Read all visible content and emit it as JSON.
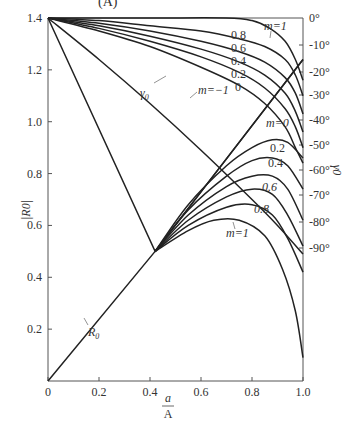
{
  "header": {
    "cropped_title_fragment": "(A)"
  },
  "chart_data": {
    "type": "line",
    "title": "",
    "xlabel": "a/A",
    "ylabel": "|R0|",
    "y2label": "γ0",
    "xlim": [
      0,
      1.0
    ],
    "ylim": [
      0,
      1.4
    ],
    "y2lim": [
      0,
      -90
    ],
    "grid": false,
    "x_ticks": [
      "0",
      "0.2",
      "0.4",
      "0.6",
      "0.8",
      "1.0"
    ],
    "y_ticks": [
      "1.4",
      "1.2",
      "1.0",
      "0.8",
      "0.6",
      "0.4",
      "0.2"
    ],
    "y2_ticks": [
      "0°",
      "-10°",
      "-20°",
      "-30°",
      "-40°",
      "-50°",
      "-60°",
      "-70°",
      "-80°",
      "-90°"
    ],
    "series": [
      {
        "name": "R0",
        "group": "magnitude",
        "label": "R0",
        "x": [
          0,
          0.42,
          1.0
        ],
        "y": [
          0,
          0.5,
          1.24
        ]
      },
      {
        "name": "|R0| m=0",
        "group": "magnitude",
        "label": "m=0",
        "x": [
          0.42,
          0.55,
          0.7,
          0.8,
          0.88,
          0.94,
          1.0
        ],
        "y": [
          0.5,
          0.68,
          0.83,
          0.9,
          0.93,
          0.92,
          0.86
        ]
      },
      {
        "name": "|R0| m=0.2",
        "group": "magnitude",
        "label": "0.2",
        "x": [
          0.42,
          0.55,
          0.7,
          0.8,
          0.88,
          0.94,
          1.0
        ],
        "y": [
          0.5,
          0.66,
          0.79,
          0.85,
          0.86,
          0.83,
          0.74
        ]
      },
      {
        "name": "|R0| m=0.4",
        "group": "magnitude",
        "label": "0.4",
        "x": [
          0.42,
          0.55,
          0.7,
          0.8,
          0.88,
          0.94,
          1.0
        ],
        "y": [
          0.5,
          0.64,
          0.75,
          0.79,
          0.79,
          0.74,
          0.62
        ]
      },
      {
        "name": "|R0| m=0.6",
        "group": "magnitude",
        "label": "0.6",
        "x": [
          0.42,
          0.55,
          0.7,
          0.8,
          0.88,
          0.94,
          1.0
        ],
        "y": [
          0.5,
          0.62,
          0.71,
          0.74,
          0.72,
          0.64,
          0.52
        ]
      },
      {
        "name": "|R0| m=0.8",
        "group": "magnitude",
        "label": "0.8",
        "x": [
          0.42,
          0.55,
          0.7,
          0.8,
          0.88,
          0.94,
          1.0
        ],
        "y": [
          0.5,
          0.6,
          0.67,
          0.68,
          0.64,
          0.55,
          0.42
        ]
      },
      {
        "name": "|R0| m=1",
        "group": "magnitude",
        "label": "m=1",
        "x": [
          0.42,
          0.55,
          0.65,
          0.75,
          0.85,
          0.92,
          0.97,
          1.0
        ],
        "y": [
          0.5,
          0.58,
          0.62,
          0.62,
          0.56,
          0.43,
          0.27,
          0.09
        ]
      },
      {
        "name": "γ0 m=-1",
        "group": "phase",
        "label": "m=-1",
        "x": [
          0,
          0.2,
          0.4,
          0.6,
          0.8,
          0.9,
          1.0
        ],
        "y": [
          1.4,
          1.24,
          1.07,
          0.89,
          0.7,
          0.6,
          0.49
        ]
      },
      {
        "name": "γ0 m=0",
        "group": "phase",
        "label": "0",
        "x": [
          0,
          0.2,
          0.4,
          0.6,
          0.75,
          0.85,
          0.93,
          0.97,
          1.0
        ],
        "y": [
          1.4,
          1.35,
          1.29,
          1.21,
          1.14,
          1.07,
          0.98,
          0.9,
          0.84
        ]
      },
      {
        "name": "γ0 m=0.2",
        "group": "phase",
        "label": "0.2",
        "x": [
          0,
          0.2,
          0.4,
          0.6,
          0.75,
          0.85,
          0.93,
          0.97,
          1.0
        ],
        "y": [
          1.4,
          1.36,
          1.31,
          1.25,
          1.19,
          1.13,
          1.05,
          0.98,
          0.9
        ]
      },
      {
        "name": "γ0 m=0.4",
        "group": "phase",
        "label": "0.4",
        "x": [
          0,
          0.2,
          0.4,
          0.6,
          0.75,
          0.85,
          0.93,
          0.97,
          1.0
        ],
        "y": [
          1.4,
          1.37,
          1.33,
          1.28,
          1.23,
          1.18,
          1.11,
          1.04,
          0.96
        ]
      },
      {
        "name": "γ0 m=0.6",
        "group": "phase",
        "label": "0.6",
        "x": [
          0,
          0.2,
          0.4,
          0.6,
          0.75,
          0.85,
          0.93,
          0.97,
          1.0
        ],
        "y": [
          1.4,
          1.38,
          1.35,
          1.31,
          1.27,
          1.23,
          1.17,
          1.11,
          1.03
        ]
      },
      {
        "name": "γ0 m=0.8",
        "group": "phase",
        "label": "0.8",
        "x": [
          0,
          0.2,
          0.4,
          0.6,
          0.75,
          0.85,
          0.93,
          0.97,
          1.0
        ],
        "y": [
          1.4,
          1.39,
          1.37,
          1.35,
          1.32,
          1.29,
          1.24,
          1.18,
          1.1
        ]
      },
      {
        "name": "γ0 m=1",
        "group": "phase",
        "label": "m=1",
        "x": [
          0,
          0.4,
          0.7,
          0.8,
          0.87,
          0.93,
          0.97,
          1.0
        ],
        "y": [
          1.4,
          1.4,
          1.4,
          1.39,
          1.36,
          1.31,
          1.24,
          1.16
        ]
      },
      {
        "name": "γ0 (reference line)",
        "group": "phase",
        "label": "γ0",
        "x": [
          0,
          0.42,
          1.0
        ],
        "y": [
          1.4,
          0.5,
          1.24
        ]
      }
    ],
    "annotations": [
      "R0",
      "γ0",
      "m=-1",
      "m=1",
      "m=0"
    ]
  },
  "labels": {
    "ylabel": "|R0|",
    "y2label": "γ0",
    "xlabel_num": "a",
    "xlabel_den": "A",
    "r0": "R",
    "r0_sub": "0",
    "gamma0": "γ",
    "gamma0_sub": "0",
    "m_neg1": "m=−1",
    "m1_top": "m=1",
    "m1_bottom": "m=1",
    "m0_mag": "m=0",
    "top_08": "0.8",
    "top_06": "0.6",
    "top_04": "0.4",
    "top_02": "0.2",
    "top_0": "0",
    "mag_02": "0.2",
    "mag_04": "0.4",
    "mag_06": "0.6",
    "mag_08": "0.8"
  }
}
